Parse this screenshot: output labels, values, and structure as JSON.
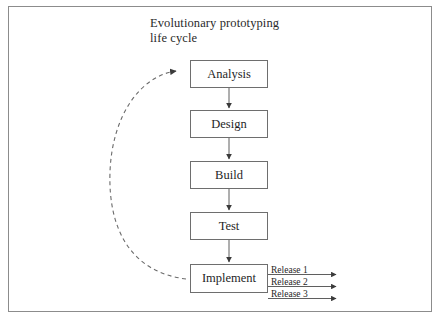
{
  "diagram": {
    "title": "Evolutionary prototyping\nlife cycle",
    "nodes": [
      {
        "id": "analysis",
        "label": "Analysis"
      },
      {
        "id": "design",
        "label": "Design"
      },
      {
        "id": "build",
        "label": "Build"
      },
      {
        "id": "test",
        "label": "Test"
      },
      {
        "id": "implement",
        "label": "Implement"
      }
    ],
    "releases": [
      {
        "label": "Release 1"
      },
      {
        "label": "Release 2"
      },
      {
        "label": "Release 3"
      }
    ],
    "feedback_loop": {
      "from": "implement",
      "to": "analysis",
      "style": "dashed"
    },
    "colors": {
      "frame_border": "#8c8c8c",
      "node_border": "#6e6e6e",
      "connector": "#5f5f5f",
      "text": "#1f1f1f",
      "title_text": "#2a2a2a",
      "background": "#ffffff"
    }
  }
}
